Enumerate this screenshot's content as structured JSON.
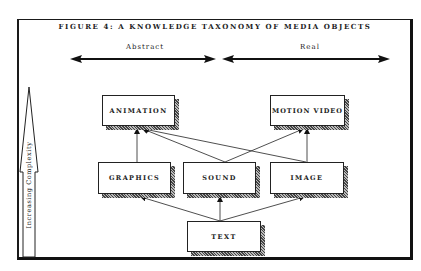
{
  "figure": {
    "title": "FIGURE 4: A KNOWLEDGE TAXONOMY OF MEDIA OBJECTS",
    "horizontal_axis": {
      "left_label": "Abstract",
      "right_label": "Real"
    },
    "vertical_axis": {
      "label": "Increasing Complexity"
    },
    "nodes": {
      "animation": "ANIMATION",
      "motion_video": "MOTION VIDEO",
      "graphics": "GRAPHICS",
      "sound": "SOUND",
      "image": "IMAGE",
      "text": "TEXT"
    },
    "edges": [
      {
        "from": "TEXT",
        "to": "GRAPHICS"
      },
      {
        "from": "TEXT",
        "to": "SOUND"
      },
      {
        "from": "TEXT",
        "to": "IMAGE"
      },
      {
        "from": "GRAPHICS",
        "to": "ANIMATION"
      },
      {
        "from": "SOUND",
        "to": "ANIMATION"
      },
      {
        "from": "SOUND",
        "to": "MOTION VIDEO"
      },
      {
        "from": "IMAGE",
        "to": "ANIMATION"
      },
      {
        "from": "IMAGE",
        "to": "MOTION VIDEO"
      }
    ]
  }
}
